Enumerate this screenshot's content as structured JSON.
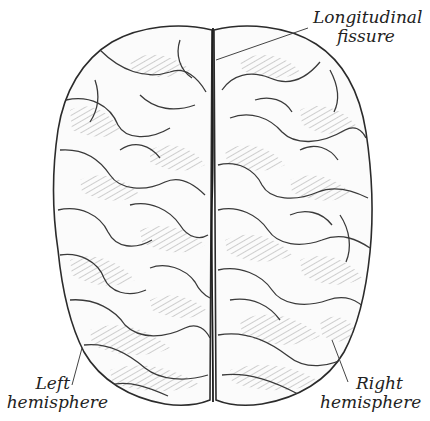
{
  "diagram": {
    "colors": {
      "outline": "#2b2b2b",
      "hatching": "#6a6a6a",
      "fill": "#fbfbfb",
      "label_text": "#222222",
      "leader_line": "#444444"
    },
    "labels": {
      "longitudinal_fissure": {
        "line1": "Longitudinal",
        "line2": "fissure"
      },
      "left_hemisphere": {
        "line1": "Left",
        "line2": "hemisphere"
      },
      "right_hemisphere": {
        "line1": "Right",
        "line2": "hemisphere"
      }
    }
  }
}
